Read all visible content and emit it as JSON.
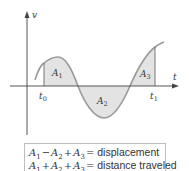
{
  "diagram": {
    "axes": {
      "y_label": "v",
      "x_label": "t"
    },
    "markers": [
      {
        "label": "t",
        "sub": "0"
      },
      {
        "label": "t",
        "sub": "1"
      }
    ],
    "regions": [
      {
        "label": "A",
        "sub": "1",
        "sign": "positive"
      },
      {
        "label": "A",
        "sub": "2",
        "sign": "negative"
      },
      {
        "label": "A",
        "sub": "3",
        "sign": "positive"
      }
    ],
    "colors": {
      "fill": "#e3e3e3",
      "curve": "#9a9a9a",
      "axis": "#444444",
      "text": "#333333"
    }
  },
  "legend": {
    "rows": [
      {
        "terms": [
          "A",
          "A",
          "A"
        ],
        "subs": [
          "1",
          "2",
          "3"
        ],
        "ops": [
          "−",
          "+"
        ],
        "eq": "=",
        "result": "displacement"
      },
      {
        "terms": [
          "A",
          "A",
          "A"
        ],
        "subs": [
          "1",
          "2",
          "3"
        ],
        "ops": [
          "+",
          "+"
        ],
        "eq": "=",
        "result": "distance traveled"
      }
    ]
  }
}
